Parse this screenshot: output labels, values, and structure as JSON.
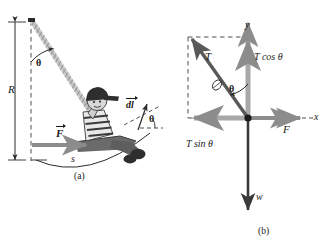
{
  "figure": {
    "panels": [
      {
        "id": "a",
        "caption": "(a)",
        "description": "Child on a swing: rope of length R from pivot, displaced by angle theta, horizontal force F applied, arc length s, tangential displacement element dl",
        "labels": {
          "radius": "R",
          "angle": "θ",
          "angle_tangent": "θ",
          "force": "F",
          "arc_length": "s",
          "displacement_element": "dl"
        }
      },
      {
        "id": "b",
        "caption": "(b)",
        "description": "Free-body diagram of the child: tension T at angle theta from the y axis, its components T cos theta and T sin theta, applied force F along x, weight w along negative y",
        "labels": {
          "y_axis": "y",
          "x_axis": "x",
          "tension": "T",
          "tension_y_component": "T cos θ",
          "tension_x_component": "T sin θ",
          "angle": "θ",
          "force": "F",
          "weight": "w"
        }
      }
    ],
    "colors": {
      "vector_gray": "#8c8c8c",
      "vector_dark": "#4d4d4d",
      "weight_dark": "#3a3a3a",
      "construction": "#6e6e6e",
      "ink": "#1a1a1a",
      "background": "#ffffff"
    }
  }
}
